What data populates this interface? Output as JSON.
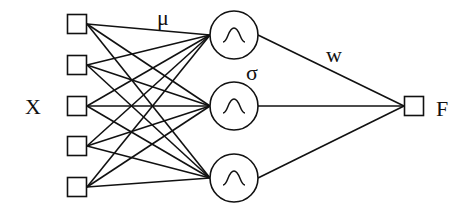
{
  "diagram": {
    "type": "rbf-network",
    "stroke_color": "#111111",
    "background": "#ffffff",
    "labels": {
      "input": "X",
      "center": "μ",
      "width": "σ",
      "weight": "w",
      "output": "F"
    },
    "input_nodes": [
      {
        "id": "x1",
        "cx": 77,
        "cy": 24
      },
      {
        "id": "x2",
        "cx": 77,
        "cy": 65
      },
      {
        "id": "x3",
        "cx": 77,
        "cy": 106
      },
      {
        "id": "x4",
        "cx": 77,
        "cy": 146
      },
      {
        "id": "x5",
        "cx": 77,
        "cy": 187
      }
    ],
    "hidden_nodes": [
      {
        "id": "h1",
        "cx": 234,
        "cy": 35,
        "r": 24,
        "icon": "gaussian-bell"
      },
      {
        "id": "h2",
        "cx": 234,
        "cy": 106,
        "r": 24,
        "icon": "gaussian-bell"
      },
      {
        "id": "h3",
        "cx": 234,
        "cy": 178,
        "r": 24,
        "icon": "gaussian-bell"
      }
    ],
    "output_node": {
      "id": "f",
      "cx": 414,
      "cy": 106
    },
    "connections": "fully connected: every input to every hidden node; every hidden node to output"
  }
}
